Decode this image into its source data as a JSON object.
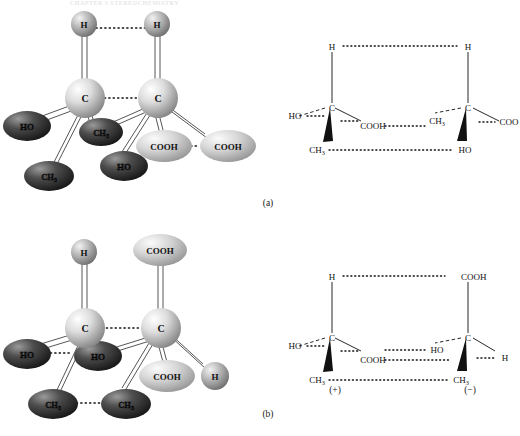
{
  "figure": {
    "running_head": "CHAPTER 5 STEREOCHEMISTRY",
    "caption_a": "(a)",
    "caption_b": "(b)",
    "sign_plus": "(+)",
    "sign_minus": "(−)"
  },
  "panel_a": {
    "model_3d": {
      "name": "meso-tartaric-acid-ball-and-stick",
      "atoms": [
        {
          "id": "a-h-left",
          "label": "H",
          "shape": "sphere",
          "tone": "mid"
        },
        {
          "id": "a-h-right",
          "label": "H",
          "shape": "sphere",
          "tone": "mid"
        },
        {
          "id": "a-c-left",
          "label": "C",
          "shape": "sphere",
          "tone": "light"
        },
        {
          "id": "a-c-right",
          "label": "C",
          "shape": "sphere",
          "tone": "light"
        },
        {
          "id": "a-ho-left",
          "label": "HO",
          "shape": "ellipse",
          "tone": "dark"
        },
        {
          "id": "a-ch3-mid",
          "label": "CH3",
          "shape": "ellipse",
          "tone": "dark"
        },
        {
          "id": "a-ch3-left",
          "label": "CH3",
          "shape": "ellipse",
          "tone": "dark"
        },
        {
          "id": "a-ho-mid",
          "label": "HO",
          "shape": "ellipse",
          "tone": "dark"
        },
        {
          "id": "a-cooh-mid",
          "label": "COOH",
          "shape": "ellipse",
          "tone": "light"
        },
        {
          "id": "a-cooh-right",
          "label": "COOH",
          "shape": "ellipse",
          "tone": "light"
        }
      ],
      "dotted_pairs": [
        {
          "from": "a-h-left",
          "to": "a-h-right"
        },
        {
          "from": "a-c-left",
          "to": "a-c-right"
        },
        {
          "from": "a-cooh-mid",
          "to": "a-cooh-right"
        }
      ]
    },
    "projection": {
      "name": "meso-tartaric-acid-projection",
      "left_center": "C",
      "right_center": "C",
      "left_top": "H",
      "right_top": "H",
      "left_dash": "HO",
      "left_plain": "COOH",
      "left_wedge": "CH3",
      "right_dash": "CH3",
      "right_plain": "COO",
      "right_wedge": "HO",
      "dotted_pairs": [
        "H···H",
        "COOH···CH3",
        "CH3···HO"
      ]
    }
  },
  "panel_b": {
    "model_3d": {
      "name": "tartaric-acid-enantiomers-ball-and-stick",
      "atoms": [
        {
          "id": "b-h-left",
          "label": "H",
          "shape": "sphere",
          "tone": "mid"
        },
        {
          "id": "b-cooh-top",
          "label": "COOH",
          "shape": "ellipse",
          "tone": "light"
        },
        {
          "id": "b-c-left",
          "label": "C",
          "shape": "sphere",
          "tone": "light"
        },
        {
          "id": "b-c-right",
          "label": "C",
          "shape": "sphere",
          "tone": "light"
        },
        {
          "id": "b-ho-left",
          "label": "HO",
          "shape": "ellipse",
          "tone": "dark"
        },
        {
          "id": "b-ho-mid",
          "label": "HO",
          "shape": "ellipse",
          "tone": "dark"
        },
        {
          "id": "b-ch3-left",
          "label": "CH3",
          "shape": "ellipse",
          "tone": "dark"
        },
        {
          "id": "b-ch3-mid",
          "label": "CH3",
          "shape": "ellipse",
          "tone": "dark"
        },
        {
          "id": "b-cooh-mid",
          "label": "COOH",
          "shape": "ellipse",
          "tone": "light"
        },
        {
          "id": "b-h-right",
          "label": "H",
          "shape": "sphere",
          "tone": "mid"
        }
      ],
      "dotted_pairs": [
        {
          "from": "b-c-left",
          "to": "b-c-right"
        },
        {
          "from": "b-ho-left",
          "to": "b-ho-mid"
        },
        {
          "from": "b-ch3-left",
          "to": "b-ch3-mid"
        }
      ]
    },
    "projection": {
      "name": "tartaric-acid-enantiomers-projection",
      "left_center": "C",
      "right_center": "C",
      "left_top": "H",
      "right_top": "COOH",
      "left_dash": "HO",
      "left_plain": "COOH",
      "left_wedge": "CH3",
      "right_dash": "HO",
      "right_plain": "H",
      "right_wedge": "CH3",
      "dotted_pairs": [
        "H···COOH",
        "COOH···HO",
        "CH3···CH3"
      ]
    }
  },
  "colors": {
    "background": "#ffffff",
    "ink": "#111111",
    "sphere_light": "#d8d8d8",
    "sphere_mid": "#a8a8a8",
    "ellipse_dark": "#3a3a3a",
    "ellipse_light": "#d2d2d2",
    "bond": "#2b2b2b"
  }
}
